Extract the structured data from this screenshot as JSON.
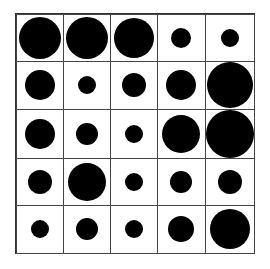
{
  "grid": {
    "rows": 5,
    "cols": 5,
    "dot_color": "#000000",
    "line_color": "#444444",
    "diameters": [
      [
        42,
        42,
        40,
        20,
        18
      ],
      [
        30,
        18,
        24,
        30,
        46
      ],
      [
        30,
        22,
        18,
        38,
        48
      ],
      [
        24,
        38,
        18,
        22,
        24
      ],
      [
        18,
        22,
        18,
        26,
        40
      ]
    ]
  }
}
